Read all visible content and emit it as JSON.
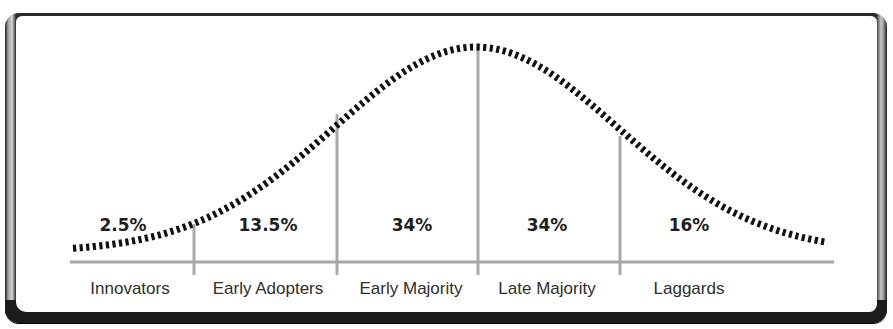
{
  "chart_data": {
    "type": "area",
    "title": "",
    "xlabel": "",
    "ylabel": "",
    "grid": false,
    "legend": null,
    "categories": [
      "Innovators",
      "Early Adopters",
      "Early Majority",
      "Late Majority",
      "Laggards"
    ],
    "values": [
      2.5,
      13.5,
      34,
      34,
      16
    ],
    "value_labels": [
      "2.5%",
      "13.5%",
      "34%",
      "34%",
      "16%"
    ],
    "unit": "%",
    "curve": {
      "style": "dotted",
      "shape": "normal distribution"
    }
  },
  "segments": [
    {
      "label": "Innovators",
      "percent": "2.5%"
    },
    {
      "label": "Early Adopters",
      "percent": "13.5%"
    },
    {
      "label": "Early Majority",
      "percent": "34%"
    },
    {
      "label": "Late Majority",
      "percent": "34%"
    },
    {
      "label": "Laggards",
      "percent": "16%"
    }
  ],
  "colors": {
    "curve": "#111111",
    "axis": "#a8a8a8",
    "text": "#1e1e1e",
    "frame": "#1c1c1c"
  }
}
